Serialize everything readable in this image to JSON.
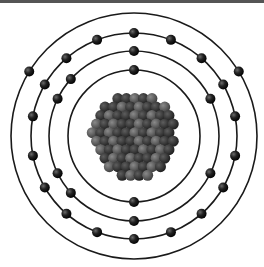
{
  "diagram": {
    "title": "",
    "center": [
      134,
      136
    ],
    "colors": {
      "frame_bar": "#555555",
      "orbit": "#1a1a1a",
      "electron": "#111111",
      "electron_highlight": "#6a6a6a",
      "nucleon_dark": "#2a2a2a",
      "nucleon_light": "#5a5a5a",
      "background": "#ffffff"
    },
    "shells": [
      {
        "name": "shell-1",
        "radius": 66,
        "electron_angles": [
          -90,
          90
        ]
      },
      {
        "name": "shell-2",
        "radius": 85,
        "electron_angles": [
          -90,
          -138,
          -26,
          154,
          90,
          26,
          -154,
          138
        ]
      },
      {
        "name": "shell-3",
        "radius": 103,
        "electron_angles": [
          -90,
          -111,
          -131,
          -150,
          -169,
          169,
          150,
          131,
          111,
          90,
          69,
          49,
          30,
          11,
          -11,
          -30,
          -49,
          -69
        ]
      },
      {
        "name": "shell-4",
        "radius": 123,
        "electron_angles": []
      }
    ],
    "outer_shell_electrons": [
      [
        30,
        72
      ],
      [
        238,
        72
      ]
    ],
    "nucleus": {
      "radius": 46,
      "nucleon_radius": 5.5,
      "nucleon_count": 80
    }
  }
}
